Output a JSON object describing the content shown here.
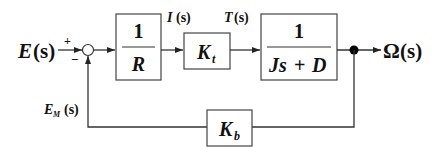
{
  "diagram": {
    "type": "block-diagram",
    "input": {
      "label_main": "E",
      "label_arg": "(s)"
    },
    "summing_junction": {
      "plus_sign": "+",
      "minus_sign": "−"
    },
    "blocks": [
      {
        "id": "resistance",
        "numerator": "1",
        "denominator": "R"
      },
      {
        "id": "torque-constant",
        "main": "K",
        "sub": "t"
      },
      {
        "id": "mechanical",
        "numerator": "1",
        "denominator_a": "Js",
        "denominator_op": "+",
        "denominator_b": "D"
      },
      {
        "id": "back-emf",
        "main": "K",
        "sub": "b"
      }
    ],
    "signals": {
      "current": {
        "main": "I",
        "arg": "(s)"
      },
      "torque": {
        "main": "T",
        "arg": "(s)"
      },
      "back_emf": {
        "main": "E",
        "sub": "M",
        "arg": "(s)"
      }
    },
    "output": {
      "label_main": "Ω",
      "label_arg": "(s)"
    }
  }
}
